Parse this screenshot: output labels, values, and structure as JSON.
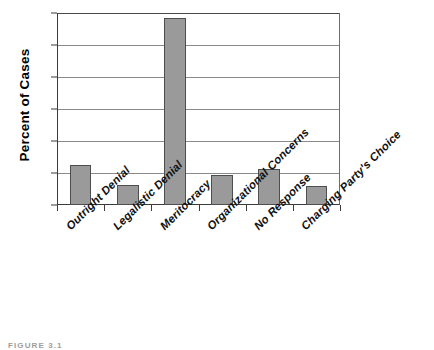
{
  "figure": {
    "caption": "FIGURE 3.1"
  },
  "chart_data": {
    "type": "bar",
    "title": "",
    "xlabel": "",
    "ylabel": "Percent of Cases",
    "categories": [
      "Outright Denial",
      "Legalistic Denial",
      "Meritocracy",
      "Organizational Concerns",
      "No Response",
      "Charging Party's Choice"
    ],
    "values": [
      12.5,
      6.2,
      58.5,
      9.5,
      11.3,
      5.8
    ],
    "ylim": [
      0,
      60
    ],
    "yticks": [
      0,
      10,
      20,
      30,
      40,
      50,
      60
    ],
    "ytick_labels": [
      "0",
      "10",
      "20",
      "30",
      "40",
      "50",
      "60"
    ],
    "grid": true,
    "legend": "none",
    "bar_color": "#9a9a9a",
    "bar_edge_color": "#4e4e4e",
    "axis_color": "#3b3b3b",
    "gridline_color": "#8a8a8a",
    "background": "#ffffff"
  }
}
